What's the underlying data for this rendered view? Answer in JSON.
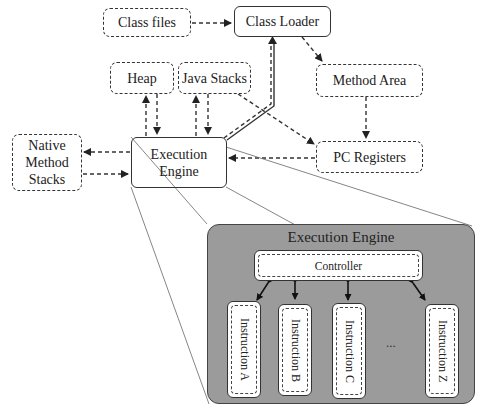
{
  "diagram": {
    "nodes": {
      "class_files": "Class files",
      "class_loader": "Class Loader",
      "heap": "Heap",
      "java_stacks": "Java Stacks",
      "method_area": "Method Area",
      "pc_registers": "PC Registers",
      "native_method_stacks": "Native\nMethod\nStacks",
      "native_line1": "Native",
      "native_line2": "Method",
      "native_line3": "Stacks",
      "execution_engine_line1": "Execution",
      "execution_engine_line2": "Engine"
    },
    "detail_panel": {
      "title": "Execution Engine",
      "controller": "Controller",
      "instructions": [
        "Instruction A",
        "Instruction B",
        "Instruction C",
        "Instruction Z"
      ],
      "ellipsis": "..."
    },
    "colors": {
      "panel_fill": "#9b9b9b",
      "stroke": "#333333",
      "background": "#ffffff"
    }
  }
}
